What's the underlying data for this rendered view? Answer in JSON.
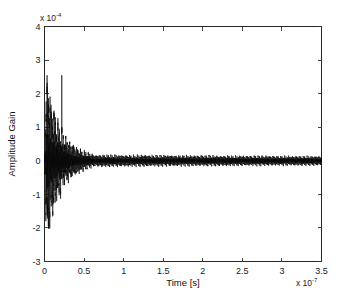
{
  "figure": {
    "background_color": "#ffffff",
    "axes_color": "#262626",
    "line_color": "#0a0a0a"
  },
  "chart_data": {
    "type": "line",
    "title": "",
    "subtitle": "",
    "xlabel": "Time [s]",
    "ylabel": "Amplitude Gain",
    "x_exponent_label": "x 10",
    "x_exponent_value": "-7",
    "y_exponent_label": "x 10",
    "y_exponent_value": "-4",
    "xlim": [
      0,
      3.5
    ],
    "ylim": [
      -3,
      4
    ],
    "x_ticks": [
      0,
      0.5,
      1,
      1.5,
      2,
      2.5,
      3,
      3.5
    ],
    "x_ticklabels": [
      "0",
      "0.5",
      "1",
      "1.5",
      "2",
      "2.5",
      "3",
      "3.5"
    ],
    "y_ticks": [
      -3,
      -2,
      -1,
      0,
      1,
      2,
      3,
      4
    ],
    "y_ticklabels": [
      "-3",
      "-2",
      "-1",
      "0",
      "1",
      "2",
      "3",
      "4"
    ],
    "grid": false,
    "legend": null,
    "legend_position": "none",
    "x_unit_scale": 1e-07,
    "y_unit_scale": 0.0001,
    "series": [
      {
        "name": "impulse response",
        "description": "Damped high-frequency oscillation: large transient burst near t=0 decaying to a thin residual band by t~0.6e-7 s, then near-zero for the remainder of the record.",
        "envelope": {
          "peak_positive": 2.55,
          "peak_negative": -2.62,
          "peak_positive_time": 0.075,
          "peak_negative_time": 0.065,
          "decay_knee_time": 0.55,
          "residual_amplitude_start": 0.14,
          "residual_amplitude_end": 0.03
        },
        "oscillation": {
          "carrier_period": 0.0062,
          "burst_end_time": 0.62
        },
        "annotations": []
      }
    ]
  },
  "axis": {
    "top_ticks_inward": true,
    "right_ticks_inward": true,
    "tick_direction": "in"
  }
}
